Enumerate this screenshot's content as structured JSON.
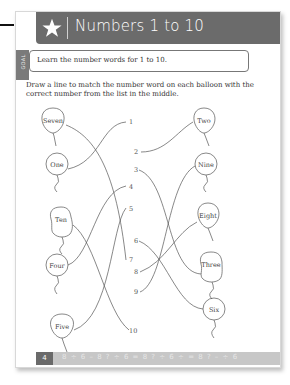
{
  "header": {
    "icon": "star-icon",
    "title": "Numbers 1 to 10"
  },
  "goal": {
    "tab_label": "GOAL",
    "text": "Learn the number words for 1 to 10."
  },
  "instructions": "Draw a line to match the number word on each balloon with the correct number from the list in the middle.",
  "left_balloons": [
    {
      "label": "Seven",
      "matches": 7
    },
    {
      "label": "One",
      "matches": 1
    },
    {
      "label": "Ten",
      "matches": 10
    },
    {
      "label": "Four",
      "matches": 4
    },
    {
      "label": "Five",
      "matches": 5
    }
  ],
  "right_balloons": [
    {
      "label": "Two",
      "matches": 2
    },
    {
      "label": "Nine",
      "matches": 9
    },
    {
      "label": "Eight",
      "matches": 8
    },
    {
      "label": "Three",
      "matches": 3
    },
    {
      "label": "Six",
      "matches": 6
    }
  ],
  "numbers": [
    "1",
    "2",
    "3",
    "4",
    "5",
    "6",
    "7",
    "8",
    "9",
    "10"
  ],
  "footer": {
    "page_number": "4",
    "decoration": "8 ÷ 6 – 8 ? ÷ 6 = 8 ? ÷ 6 ÷ = 8 ? – ÷ 6"
  }
}
